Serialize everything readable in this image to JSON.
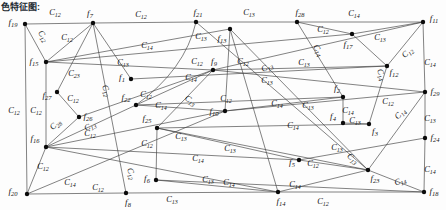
{
  "caption": {
    "text": "色特征图:"
  },
  "figure": {
    "bg": "#fdfdfd",
    "line_color": "#3f3f3f",
    "node_color": "#0b0b0b",
    "text_color": "#141414",
    "nodes": [
      {
        "id": "f19",
        "t": "f",
        "s": "19",
        "x": 25,
        "y": 24,
        "lx": 13,
        "ly": 22
      },
      {
        "id": "f7",
        "t": "f",
        "s": "7",
        "x": 93,
        "y": 23,
        "lx": 90,
        "ly": 13
      },
      {
        "id": "f21",
        "t": "f",
        "s": "21",
        "x": 196,
        "y": 22,
        "lx": 198,
        "ly": 12
      },
      {
        "id": "f28",
        "t": "f",
        "s": "28",
        "x": 297,
        "y": 22,
        "lx": 300,
        "ly": 12
      },
      {
        "id": "f11",
        "t": "f",
        "s": "11",
        "x": 423,
        "y": 22,
        "lx": 434,
        "ly": 18
      },
      {
        "id": "f13",
        "t": "f",
        "s": "13",
        "x": 230,
        "y": 29,
        "lx": 222,
        "ly": 38
      },
      {
        "id": "f17",
        "t": "f",
        "s": "17",
        "x": 352,
        "y": 34,
        "lx": 348,
        "ly": 44
      },
      {
        "id": "f15",
        "t": "f",
        "s": "15",
        "x": 46,
        "y": 62,
        "lx": 34,
        "ly": 61
      },
      {
        "id": "f9",
        "t": "f",
        "s": "9",
        "x": 213,
        "y": 70,
        "lx": 214,
        "ly": 61
      },
      {
        "id": "f12",
        "t": "f",
        "s": "12",
        "x": 387,
        "y": 66,
        "lx": 394,
        "ly": 72
      },
      {
        "id": "f1",
        "t": "f",
        "s": "1",
        "x": 131,
        "y": 79,
        "lx": 122,
        "ly": 77
      },
      {
        "id": "f27",
        "t": "f",
        "s": "27",
        "x": 57,
        "y": 92,
        "lx": 47,
        "ly": 95
      },
      {
        "id": "f2",
        "t": "f",
        "s": "2",
        "x": 343,
        "y": 97,
        "lx": 337,
        "ly": 88
      },
      {
        "id": "f29",
        "t": "f",
        "s": "29",
        "x": 425,
        "y": 92,
        "lx": 435,
        "ly": 91
      },
      {
        "id": "f22",
        "t": "f",
        "s": "22",
        "x": 136,
        "y": 105,
        "lx": 126,
        "ly": 97
      },
      {
        "id": "f10",
        "t": "f",
        "s": "10",
        "x": 225,
        "y": 111,
        "lx": 214,
        "ly": 111
      },
      {
        "id": "f26",
        "t": "f",
        "s": "26",
        "x": 79,
        "y": 117,
        "lx": 88,
        "ly": 116
      },
      {
        "id": "f4",
        "t": "f",
        "s": "4",
        "x": 343,
        "y": 123,
        "lx": 333,
        "ly": 116
      },
      {
        "id": "f3",
        "t": "f",
        "s": "3",
        "x": 369,
        "y": 124,
        "lx": 375,
        "ly": 131
      },
      {
        "id": "f25",
        "t": "f",
        "s": "25",
        "x": 157,
        "y": 128,
        "lx": 147,
        "ly": 118
      },
      {
        "id": "f24",
        "t": "f",
        "s": "24",
        "x": 425,
        "y": 138,
        "lx": 435,
        "ly": 137
      },
      {
        "id": "f16",
        "t": "f",
        "s": "16",
        "x": 46,
        "y": 147,
        "lx": 35,
        "ly": 138
      },
      {
        "id": "f5",
        "t": "f",
        "s": "5",
        "x": 299,
        "y": 160,
        "lx": 292,
        "ly": 162
      },
      {
        "id": "f23",
        "t": "f",
        "s": "23",
        "x": 368,
        "y": 170,
        "lx": 375,
        "ly": 178
      },
      {
        "id": "f6",
        "t": "f",
        "s": "6",
        "x": 156,
        "y": 180,
        "lx": 147,
        "ly": 178
      },
      {
        "id": "f8",
        "t": "f",
        "s": "8",
        "x": 126,
        "y": 193,
        "lx": 128,
        "ly": 202
      },
      {
        "id": "f14",
        "t": "f",
        "s": "14",
        "x": 278,
        "y": 192,
        "lx": 281,
        "ly": 201
      },
      {
        "id": "f18",
        "t": "f",
        "s": "18",
        "x": 424,
        "y": 192,
        "lx": 434,
        "ly": 191
      },
      {
        "id": "f20",
        "t": "f",
        "s": "20",
        "x": 27,
        "y": 194,
        "lx": 13,
        "ly": 191
      }
    ],
    "edges": [
      {
        "a": "f19",
        "b": "f7"
      },
      {
        "a": "f7",
        "b": "f21"
      },
      {
        "a": "f21",
        "b": "f28"
      },
      {
        "a": "f28",
        "b": "f11"
      },
      {
        "a": "f19",
        "b": "f20"
      },
      {
        "a": "f11",
        "b": "f29"
      },
      {
        "a": "f29",
        "b": "f24"
      },
      {
        "a": "f24",
        "b": "f18"
      },
      {
        "a": "f20",
        "b": "f8"
      },
      {
        "a": "f8",
        "b": "f14"
      },
      {
        "a": "f14",
        "b": "f18"
      },
      {
        "a": "f19",
        "b": "f15"
      },
      {
        "a": "f7",
        "b": "f15"
      },
      {
        "a": "f15",
        "b": "f13"
      },
      {
        "a": "f15",
        "b": "f17"
      },
      {
        "a": "f7",
        "b": "f1"
      },
      {
        "a": "f15",
        "b": "f9"
      },
      {
        "a": "f9",
        "b": "f11"
      },
      {
        "a": "f9",
        "b": "f12"
      },
      {
        "a": "f1",
        "b": "f12"
      },
      {
        "a": "f9",
        "b": "f29"
      },
      {
        "a": "f9",
        "b": "f22"
      },
      {
        "a": "f28",
        "b": "f17"
      },
      {
        "a": "f17",
        "b": "f11"
      },
      {
        "a": "f17",
        "b": "f12"
      },
      {
        "a": "f12",
        "b": "f11"
      },
      {
        "a": "f28",
        "b": "f2"
      },
      {
        "a": "f12",
        "b": "f3"
      },
      {
        "a": "f29",
        "b": "f10"
      },
      {
        "a": "f29",
        "b": "f23"
      },
      {
        "a": "f25",
        "b": "f3"
      },
      {
        "a": "f4",
        "b": "f3"
      },
      {
        "a": "f2",
        "b": "f4"
      },
      {
        "a": "f24",
        "b": "f5"
      },
      {
        "a": "f13",
        "b": "f23"
      },
      {
        "a": "f5",
        "b": "f23"
      },
      {
        "a": "f23",
        "b": "f18"
      },
      {
        "a": "f6",
        "b": "f14"
      },
      {
        "a": "f6",
        "b": "f18"
      },
      {
        "a": "f14",
        "b": "f23"
      },
      {
        "a": "f16",
        "b": "f26"
      },
      {
        "a": "f27",
        "b": "f26"
      },
      {
        "a": "f7",
        "b": "f27"
      },
      {
        "a": "f15",
        "b": "f16"
      },
      {
        "a": "f22",
        "b": "f16"
      },
      {
        "a": "f16",
        "b": "f10"
      },
      {
        "a": "f26",
        "b": "f9"
      },
      {
        "a": "f22",
        "b": "f2"
      },
      {
        "a": "f10",
        "b": "f2"
      },
      {
        "a": "f25",
        "b": "f23"
      },
      {
        "a": "f25",
        "b": "f5"
      },
      {
        "a": "f25",
        "b": "f6"
      },
      {
        "a": "f16",
        "b": "f20"
      },
      {
        "a": "f20",
        "b": "f10"
      },
      {
        "a": "f13",
        "b": "f10"
      },
      {
        "a": "f9",
        "b": "f25"
      },
      {
        "a": "f22",
        "b": "f10"
      },
      {
        "a": "f13",
        "b": "f14"
      },
      {
        "a": "f16",
        "b": "f14"
      },
      {
        "a": "f21",
        "b": "f23"
      },
      {
        "a": "f16",
        "b": "f5"
      },
      {
        "a": "f7",
        "b": "f8"
      },
      {
        "a": "f21",
        "b": "f22",
        "c": [
          185,
          70
        ]
      }
    ],
    "edge_labels": [
      {
        "t": "C",
        "s": "12",
        "x": 55,
        "y": 12,
        "r": 0
      },
      {
        "t": "C",
        "s": "12",
        "x": 141,
        "y": 14,
        "r": 0
      },
      {
        "t": "C",
        "s": "13",
        "x": 249,
        "y": 12,
        "r": 0
      },
      {
        "t": "C",
        "s": "14",
        "x": 354,
        "y": 13,
        "r": 0
      },
      {
        "t": "C",
        "s": "12",
        "x": 41,
        "y": 35,
        "r": 55
      },
      {
        "t": "C",
        "s": "12",
        "x": 67,
        "y": 37,
        "r": 0
      },
      {
        "t": "C",
        "s": "14",
        "x": 147,
        "y": 45,
        "r": 0
      },
      {
        "t": "C",
        "s": "13",
        "x": 201,
        "y": 36,
        "r": 0
      },
      {
        "t": "C",
        "s": "12",
        "x": 323,
        "y": 29,
        "r": 0
      },
      {
        "t": "C",
        "s": "13",
        "x": 380,
        "y": 37,
        "r": 0
      },
      {
        "t": "C",
        "s": "12",
        "x": 409,
        "y": 52,
        "r": -40
      },
      {
        "t": "C",
        "s": "13",
        "x": 123,
        "y": 62,
        "r": 0
      },
      {
        "t": "C",
        "s": "12",
        "x": 197,
        "y": 61,
        "r": 0
      },
      {
        "t": "C",
        "s": "12",
        "x": 243,
        "y": 61,
        "r": 0
      },
      {
        "t": "C",
        "s": "13",
        "x": 268,
        "y": 67,
        "r": -25
      },
      {
        "t": "C",
        "s": "13",
        "x": 304,
        "y": 62,
        "r": 0
      },
      {
        "t": "C",
        "s": "14",
        "x": 316,
        "y": 49,
        "r": 60
      },
      {
        "t": "C",
        "s": "14",
        "x": 379,
        "y": 73,
        "r": 70
      },
      {
        "t": "C",
        "s": "14",
        "x": 430,
        "y": 62,
        "r": 0
      },
      {
        "t": "C",
        "s": "23",
        "x": 74,
        "y": 73,
        "r": 0
      },
      {
        "t": "C",
        "s": "14",
        "x": 191,
        "y": 77,
        "r": 0
      },
      {
        "t": "C",
        "s": "13",
        "x": 267,
        "y": 80,
        "r": 0
      },
      {
        "t": "C",
        "s": "12",
        "x": 104,
        "y": 89,
        "r": 70
      },
      {
        "t": "C",
        "s": "12",
        "x": 73,
        "y": 98,
        "r": 0
      },
      {
        "t": "C",
        "s": "12",
        "x": 146,
        "y": 94,
        "r": 0
      },
      {
        "t": "C",
        "s": "14",
        "x": 161,
        "y": 105,
        "r": 0
      },
      {
        "t": "C",
        "s": "12",
        "x": 226,
        "y": 98,
        "r": 0
      },
      {
        "t": "C",
        "s": "13",
        "x": 189,
        "y": 100,
        "r": 35
      },
      {
        "t": "C",
        "s": "14",
        "x": 277,
        "y": 103,
        "r": 0
      },
      {
        "t": "C",
        "s": "13",
        "x": 308,
        "y": 105,
        "r": 0
      },
      {
        "t": "C",
        "s": "12",
        "x": 388,
        "y": 101,
        "r": 0
      },
      {
        "t": "C",
        "s": "14",
        "x": 402,
        "y": 113,
        "r": -45
      },
      {
        "t": "C",
        "s": "13",
        "x": 430,
        "y": 118,
        "r": 0
      },
      {
        "t": "C",
        "s": "28",
        "x": 57,
        "y": 124,
        "r": -40
      },
      {
        "t": "C",
        "s": "13",
        "x": 91,
        "y": 126,
        "r": -25
      },
      {
        "t": "C",
        "s": "12",
        "x": 90,
        "y": 133,
        "r": 0
      },
      {
        "t": "C",
        "s": "12",
        "x": 14,
        "y": 110,
        "r": 0
      },
      {
        "t": "C",
        "s": "12",
        "x": 36,
        "y": 110,
        "r": 0
      },
      {
        "t": "C",
        "s": "12",
        "x": 147,
        "y": 143,
        "r": 0
      },
      {
        "t": "C",
        "s": "14",
        "x": 293,
        "y": 125,
        "r": 0
      },
      {
        "t": "C",
        "s": "13",
        "x": 355,
        "y": 120,
        "r": 0
      },
      {
        "t": "C",
        "s": "14",
        "x": 348,
        "y": 110,
        "r": 0
      },
      {
        "t": "C",
        "s": "13",
        "x": 337,
        "y": 147,
        "r": 0
      },
      {
        "t": "C",
        "s": "13",
        "x": 351,
        "y": 158,
        "r": 40
      },
      {
        "t": "C",
        "s": "12",
        "x": 313,
        "y": 163,
        "r": 0
      },
      {
        "t": "C",
        "s": "14",
        "x": 430,
        "y": 169,
        "r": 0
      },
      {
        "t": "C",
        "s": "14",
        "x": 401,
        "y": 181,
        "r": -20
      },
      {
        "t": "C",
        "s": "12",
        "x": 43,
        "y": 166,
        "r": 0
      },
      {
        "t": "C",
        "s": "14",
        "x": 70,
        "y": 182,
        "r": 0
      },
      {
        "t": "C",
        "s": "12",
        "x": 98,
        "y": 187,
        "r": 0
      },
      {
        "t": "C",
        "s": "12",
        "x": 129,
        "y": 172,
        "r": 70
      },
      {
        "t": "C",
        "s": "13",
        "x": 172,
        "y": 199,
        "r": 0
      },
      {
        "t": "C",
        "s": "12",
        "x": 323,
        "y": 201,
        "r": 0
      },
      {
        "t": "C",
        "s": "14",
        "x": 198,
        "y": 158,
        "r": 0
      },
      {
        "t": "C",
        "s": "13",
        "x": 208,
        "y": 179,
        "r": 0
      },
      {
        "t": "C",
        "s": "14",
        "x": 229,
        "y": 182,
        "r": 0
      },
      {
        "t": "C",
        "s": "14",
        "x": 295,
        "y": 184,
        "r": 0
      },
      {
        "t": "C",
        "s": "13",
        "x": 181,
        "y": 136,
        "r": 0
      },
      {
        "t": "C",
        "s": "13",
        "x": 230,
        "y": 148,
        "r": 0
      }
    ]
  }
}
